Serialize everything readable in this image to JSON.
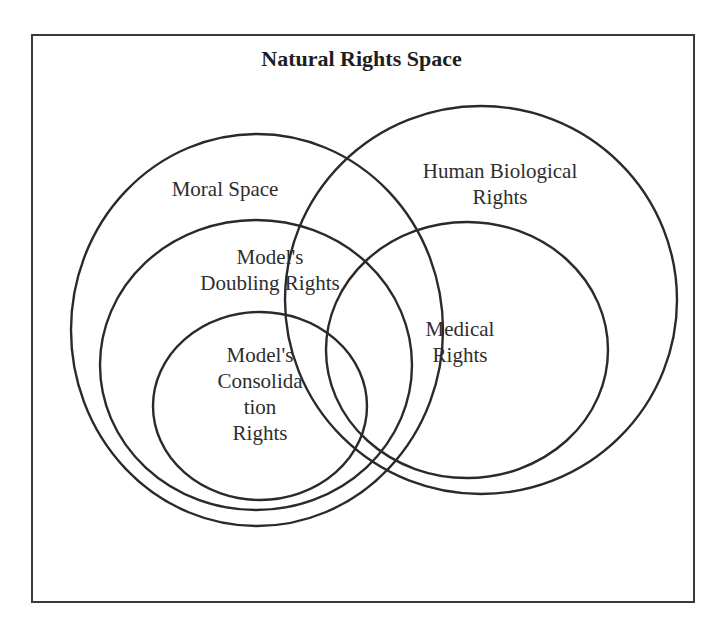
{
  "diagram": {
    "title": "Natural Rights Space",
    "stroke_color": "#2a2a2a",
    "sets": [
      {
        "id": "moral",
        "label": "Moral Space",
        "cx": 257,
        "cy": 330,
        "rx": 186,
        "ry": 196
      },
      {
        "id": "doubling",
        "label": "Model's\nDoubling Rights",
        "cx": 256,
        "cy": 365,
        "rx": 156,
        "ry": 145
      },
      {
        "id": "consolidation",
        "label": "Model's\nConsolida\ntion\nRights",
        "cx": 260,
        "cy": 406,
        "rx": 107,
        "ry": 94
      },
      {
        "id": "human_biological",
        "label": "Human Biological\nRights",
        "cx": 481,
        "cy": 300,
        "rx": 196,
        "ry": 194
      },
      {
        "id": "medical",
        "label": "Medical\nRights",
        "cx": 467,
        "cy": 350,
        "rx": 141,
        "ry": 128
      }
    ]
  }
}
